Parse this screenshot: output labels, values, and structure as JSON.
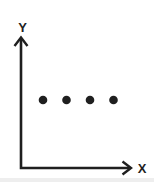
{
  "page": {
    "background": "#ffffff",
    "ink_color": "#1f1f1f",
    "artifact_color": "#e3e3e3"
  },
  "axes": {
    "x_label": "X",
    "y_label": "Y"
  },
  "chart_data": {
    "type": "scatter",
    "title": "",
    "xlabel": "X",
    "ylabel": "Y",
    "x": [
      1,
      2,
      3,
      4
    ],
    "y": [
      1,
      1,
      1,
      1
    ],
    "axis_tick_labels": false,
    "grid": false,
    "legend": false,
    "pixel_geometry": {
      "origin": {
        "x": 21,
        "y": 168
      },
      "y_axis_tip": {
        "x": 21,
        "y": 37
      },
      "x_axis_tip": {
        "x": 131,
        "y": 168
      },
      "points": [
        {
          "x": 43,
          "y": 100
        },
        {
          "x": 66.5,
          "y": 100
        },
        {
          "x": 90,
          "y": 100
        },
        {
          "x": 113.5,
          "y": 100
        }
      ],
      "dot_radius": 4.3
    }
  }
}
